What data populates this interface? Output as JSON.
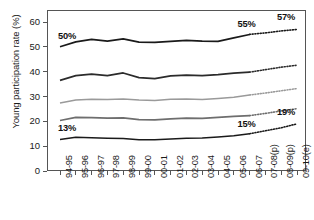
{
  "chart_data": {
    "type": "line",
    "title": "",
    "xlabel": "",
    "ylabel": "Young participation rate (%)",
    "ylim": [
      0,
      63
    ],
    "yticks": [
      0,
      10,
      20,
      30,
      40,
      50,
      60
    ],
    "ytick_labels": [
      "0",
      "10",
      "20",
      "30",
      "40",
      "50",
      "60"
    ],
    "grid": false,
    "legend_position": "none",
    "categories": [
      "94-95",
      "95-96",
      "96-97",
      "97-98",
      "98-99",
      "99-00",
      "00-01",
      "01-02",
      "02-03",
      "03-04",
      "04-05",
      "05-06",
      "06-07",
      "07-08(p)",
      "08-09(p)",
      "09-10(e)"
    ],
    "projection_start_index": 12,
    "series": [
      {
        "name": "Quintile 5 (most advantaged)",
        "color": "#1a1a1a",
        "values": [
          50.0,
          52.0,
          53.0,
          52.3,
          53.2,
          51.9,
          51.8,
          52.2,
          52.6,
          52.3,
          52.2,
          53.6,
          55.0,
          55.6,
          56.4,
          57.0
        ]
      },
      {
        "name": "Quintile 4",
        "color": "#2b2b2b",
        "values": [
          36.5,
          38.4,
          39.0,
          38.4,
          39.5,
          37.6,
          37.2,
          38.3,
          38.6,
          38.4,
          38.8,
          39.4,
          39.8,
          40.8,
          41.8,
          42.6
        ]
      },
      {
        "name": "Quintile 3",
        "color": "#9a9a9a",
        "values": [
          27.4,
          28.6,
          28.9,
          28.8,
          29.0,
          28.6,
          28.4,
          28.9,
          29.0,
          28.8,
          29.2,
          29.7,
          30.6,
          31.4,
          32.3,
          33.2
        ]
      },
      {
        "name": "Quintile 2",
        "color": "#6e6e6e",
        "values": [
          20.3,
          21.6,
          21.5,
          21.3,
          21.4,
          20.7,
          20.6,
          21.0,
          21.3,
          21.2,
          21.6,
          22.0,
          22.3,
          23.2,
          24.2,
          25.1
        ]
      },
      {
        "name": "Quintile 1 (least advantaged)",
        "color": "#1a1a1a",
        "values": [
          12.7,
          13.6,
          13.4,
          13.2,
          13.1,
          12.6,
          12.6,
          12.9,
          13.2,
          13.3,
          13.7,
          14.2,
          15.0,
          16.2,
          17.4,
          19.0
        ]
      }
    ],
    "annotations": [
      {
        "text": "50%",
        "series": 0,
        "index": 0,
        "pos": "above-left"
      },
      {
        "text": "55%",
        "series": 0,
        "index": 12,
        "pos": "above"
      },
      {
        "text": "57%",
        "series": 0,
        "index": 15,
        "pos": "above"
      },
      {
        "text": "13%",
        "series": 4,
        "index": 0,
        "pos": "above-left"
      },
      {
        "text": "15%",
        "series": 4,
        "index": 12,
        "pos": "above"
      },
      {
        "text": "19%",
        "series": 4,
        "index": 15,
        "pos": "above"
      }
    ]
  }
}
